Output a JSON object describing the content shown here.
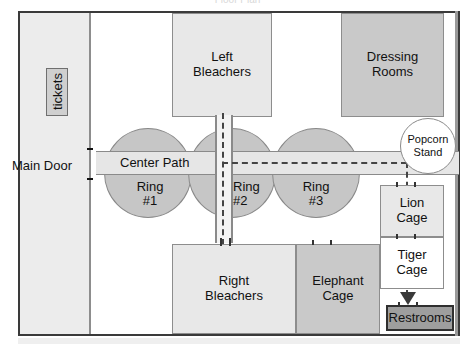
{
  "title_fragment": "Floor Plan",
  "plan": {
    "main_door": "Main Door",
    "tickets": "tickets",
    "center_path": "Center Path",
    "left_bleachers": "Left\nBleachers",
    "right_bleachers": "Right\nBleachers",
    "dressing_rooms": "Dressing\nRooms",
    "elephant_cage": "Elephant\nCage",
    "lion_cage": "Lion\nCage",
    "tiger_cage": "Tiger\nCage",
    "restrooms": "Restrooms",
    "popcorn_stand": "Popcorn\nStand",
    "ring1": "Ring\n#1",
    "ring2": "Ring\n#2",
    "ring3": "Ring\n#3"
  },
  "colors": {
    "frame": "#3a3a3a",
    "room_light": "#e8e8e8",
    "room_mid": "#c9c9c9",
    "room_dark": "#9e9e9e",
    "ring_fill": "#c6c6c6",
    "path_fill": "#e6e6e6",
    "route_dash": "#444444"
  }
}
